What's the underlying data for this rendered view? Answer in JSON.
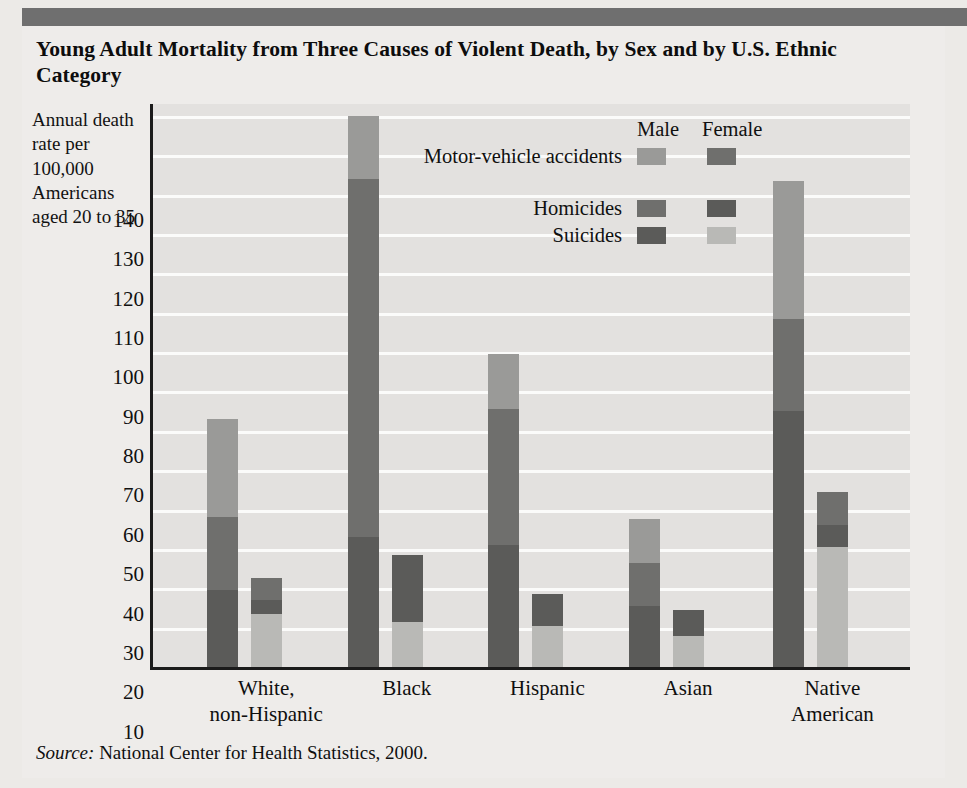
{
  "title": "Young Adult Mortality from Three Causes of Violent Death, by Sex and by U.S. Ethnic Category",
  "y_axis_caption": "Annual death rate per 100,000 Americans aged 20 to 35",
  "source_prefix": "Source:",
  "source_text": " National Center for Health Statistics, 2000.",
  "legend": {
    "male_header": "Male",
    "female_header": "Female",
    "rows": [
      {
        "label": "Motor-vehicle accidents",
        "male_color": "#9a9a98",
        "female_color": "#6f6f6d"
      },
      {
        "label": "Homicides",
        "male_color": "#6f6f6d",
        "female_color": "#5b5b59"
      },
      {
        "label": "Suicides",
        "male_color": "#5b5b59",
        "female_color": "#b9b9b6"
      }
    ]
  },
  "colors": {
    "background": "#eceae7",
    "plot_background": "#e3e1df",
    "gridline": "#fbfbfa",
    "axis": "#1b1b1b",
    "topbar": "#6f6f6f",
    "motor_vehicle_male": "#9a9a98",
    "homicides_male": "#6f6f6d",
    "suicides_male": "#5b5b59",
    "motor_vehicle_female": "#6f6f6d",
    "homicides_female": "#5b5b59",
    "suicides_female": "#b9b9b6"
  },
  "chart_data": {
    "type": "bar",
    "subtype": "stacked-grouped",
    "title": "Young Adult Mortality from Three Causes of Violent Death, by Sex and by U.S. Ethnic Category",
    "xlabel": "",
    "ylabel": "Annual death rate per 100,000 Americans aged 20 to 35",
    "ylim": [
      0,
      143
    ],
    "yticks": [
      10,
      20,
      30,
      40,
      50,
      60,
      70,
      80,
      90,
      100,
      110,
      120,
      130,
      140
    ],
    "ytick_labels": [
      "10",
      "20",
      "30",
      "40",
      "50",
      "60",
      "70",
      "80",
      "90",
      "100",
      "110",
      "120",
      "130",
      "140"
    ],
    "grid": true,
    "legend_position": "inside-top-right",
    "categories": [
      "White, non-Hispanic",
      "Black",
      "Hispanic",
      "Asian",
      "Native American"
    ],
    "category_labels": [
      "White,\nnon-Hispanic",
      "Black",
      "Hispanic",
      "Asian",
      "Native\nAmerican"
    ],
    "sexes": [
      "Male",
      "Female"
    ],
    "causes": [
      "Suicides",
      "Homicides",
      "Motor-vehicle accidents"
    ],
    "series": [
      {
        "name": "Male - Suicides",
        "sex": "Male",
        "cause": "Suicides",
        "values": [
          19.5,
          33.0,
          31.0,
          15.5,
          65.0
        ]
      },
      {
        "name": "Male - Homicides",
        "sex": "Male",
        "cause": "Homicides",
        "values": [
          18.5,
          91.0,
          34.5,
          11.0,
          23.5
        ]
      },
      {
        "name": "Male - Motor-vehicle accidents",
        "sex": "Male",
        "cause": "Motor-vehicle accidents",
        "values": [
          25.0,
          16.0,
          14.0,
          11.0,
          35.0
        ]
      },
      {
        "name": "Female - Suicides",
        "sex": "Female",
        "cause": "Suicides",
        "values": [
          13.5,
          11.5,
          10.5,
          8.0,
          30.5
        ]
      },
      {
        "name": "Female - Homicides",
        "sex": "Female",
        "cause": "Homicides",
        "values": [
          3.5,
          17.0,
          8.0,
          6.5,
          5.5
        ]
      },
      {
        "name": "Female - Motor-vehicle accidents",
        "sex": "Female",
        "cause": "Motor-vehicle accidents",
        "values": [
          5.5,
          0.0,
          0.0,
          0.0,
          8.5
        ]
      }
    ],
    "totals": {
      "male": [
        63.0,
        140.0,
        79.5,
        37.5,
        123.5
      ],
      "female": [
        22.5,
        28.5,
        18.5,
        14.5,
        44.5
      ]
    }
  },
  "bars": [
    {
      "group": "White, non-Hispanic",
      "center_pct": 12.0,
      "male": [
        {
          "cause": "Suicides",
          "value": 19.5,
          "color": "#5b5b59"
        },
        {
          "cause": "Homicides",
          "value": 18.5,
          "color": "#6f6f6d"
        },
        {
          "cause": "Motor-vehicle accidents",
          "value": 25.0,
          "color": "#9a9a98"
        }
      ],
      "female": [
        {
          "cause": "Suicides",
          "value": 13.5,
          "color": "#b9b9b6"
        },
        {
          "cause": "Homicides",
          "value": 3.5,
          "color": "#5b5b59"
        },
        {
          "cause": "Motor-vehicle accidents",
          "value": 5.5,
          "color": "#6f6f6d"
        }
      ]
    },
    {
      "group": "Black",
      "center_pct": 30.5,
      "male": [
        {
          "cause": "Suicides",
          "value": 33.0,
          "color": "#5b5b59"
        },
        {
          "cause": "Homicides",
          "value": 91.0,
          "color": "#6f6f6d"
        },
        {
          "cause": "Motor-vehicle accidents",
          "value": 16.0,
          "color": "#9a9a98"
        }
      ],
      "female": [
        {
          "cause": "Suicides",
          "value": 11.5,
          "color": "#b9b9b6"
        },
        {
          "cause": "Homicides",
          "value": 17.0,
          "color": "#5b5b59"
        },
        {
          "cause": "Motor-vehicle accidents",
          "value": 0.0,
          "color": "#6f6f6d"
        }
      ]
    },
    {
      "group": "Hispanic",
      "center_pct": 49.0,
      "male": [
        {
          "cause": "Suicides",
          "value": 31.0,
          "color": "#5b5b59"
        },
        {
          "cause": "Homicides",
          "value": 34.5,
          "color": "#6f6f6d"
        },
        {
          "cause": "Motor-vehicle accidents",
          "value": 14.0,
          "color": "#9a9a98"
        }
      ],
      "female": [
        {
          "cause": "Suicides",
          "value": 10.5,
          "color": "#b9b9b6"
        },
        {
          "cause": "Homicides",
          "value": 8.0,
          "color": "#5b5b59"
        },
        {
          "cause": "Motor-vehicle accidents",
          "value": 0.0,
          "color": "#6f6f6d"
        }
      ]
    },
    {
      "group": "Asian",
      "center_pct": 67.5,
      "male": [
        {
          "cause": "Suicides",
          "value": 15.5,
          "color": "#5b5b59"
        },
        {
          "cause": "Homicides",
          "value": 11.0,
          "color": "#6f6f6d"
        },
        {
          "cause": "Motor-vehicle accidents",
          "value": 11.0,
          "color": "#9a9a98"
        }
      ],
      "female": [
        {
          "cause": "Suicides",
          "value": 8.0,
          "color": "#b9b9b6"
        },
        {
          "cause": "Homicides",
          "value": 6.5,
          "color": "#5b5b59"
        },
        {
          "cause": "Motor-vehicle accidents",
          "value": 0.0,
          "color": "#6f6f6d"
        }
      ]
    },
    {
      "group": "Native American",
      "center_pct": 86.5,
      "male": [
        {
          "cause": "Suicides",
          "value": 65.0,
          "color": "#5b5b59"
        },
        {
          "cause": "Homicides",
          "value": 23.5,
          "color": "#6f6f6d"
        },
        {
          "cause": "Motor-vehicle accidents",
          "value": 35.0,
          "color": "#9a9a98"
        }
      ],
      "female": [
        {
          "cause": "Suicides",
          "value": 30.5,
          "color": "#b9b9b6"
        },
        {
          "cause": "Homicides",
          "value": 5.5,
          "color": "#5b5b59"
        },
        {
          "cause": "Motor-vehicle accidents",
          "value": 8.5,
          "color": "#6f6f6d"
        }
      ]
    }
  ]
}
